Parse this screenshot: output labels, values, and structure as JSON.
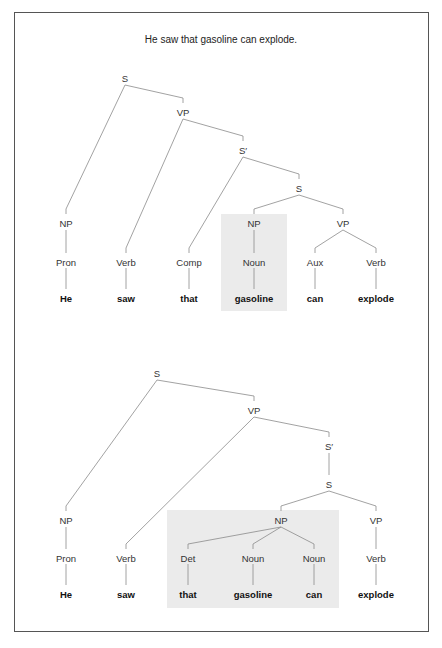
{
  "title": "He saw that gasoline can explode.",
  "colors": {
    "line": "#8a8a8a",
    "highlight": "#ebebeb",
    "border": "#555555"
  },
  "trees": [
    {
      "name": "top-tree",
      "highlight": {
        "x": 221,
        "y": 214,
        "w": 66,
        "h": 97
      },
      "nodes": [
        {
          "id": "S",
          "label": "S",
          "x": 125,
          "y": 78
        },
        {
          "id": "VP",
          "label": "VP",
          "x": 183,
          "y": 112
        },
        {
          "id": "Sp",
          "label": "S′",
          "x": 243,
          "y": 150
        },
        {
          "id": "S2",
          "label": "S",
          "x": 299,
          "y": 188
        },
        {
          "id": "NP1",
          "label": "NP",
          "x": 66,
          "y": 223
        },
        {
          "id": "NP2",
          "label": "NP",
          "x": 254,
          "y": 223
        },
        {
          "id": "VP2",
          "label": "VP",
          "x": 343,
          "y": 223
        },
        {
          "id": "Pron",
          "label": "Pron",
          "x": 66,
          "y": 262
        },
        {
          "id": "Verb1",
          "label": "Verb",
          "x": 126,
          "y": 262
        },
        {
          "id": "Comp",
          "label": "Comp",
          "x": 189,
          "y": 262
        },
        {
          "id": "Noun",
          "label": "Noun",
          "x": 254,
          "y": 262
        },
        {
          "id": "Aux",
          "label": "Aux",
          "x": 315,
          "y": 262
        },
        {
          "id": "Verb2",
          "label": "Verb",
          "x": 376,
          "y": 262
        }
      ],
      "words": [
        {
          "parent": "Pron",
          "text": "He",
          "x": 66,
          "y": 298
        },
        {
          "parent": "Verb1",
          "text": "saw",
          "x": 126,
          "y": 298
        },
        {
          "parent": "Comp",
          "text": "that",
          "x": 189,
          "y": 298
        },
        {
          "parent": "Noun",
          "text": "gasoline",
          "x": 254,
          "y": 298
        },
        {
          "parent": "Aux",
          "text": "can",
          "x": 315,
          "y": 298
        },
        {
          "parent": "Verb2",
          "text": "explode",
          "x": 376,
          "y": 298
        }
      ],
      "edges": [
        [
          "S",
          "NP1"
        ],
        [
          "S",
          "VP"
        ],
        [
          "VP",
          "Verb1"
        ],
        [
          "VP",
          "Sp"
        ],
        [
          "Sp",
          "Comp"
        ],
        [
          "Sp",
          "S2"
        ],
        [
          "S2",
          "NP2"
        ],
        [
          "S2",
          "VP2"
        ],
        [
          "NP1",
          "Pron"
        ],
        [
          "NP2",
          "Noun"
        ],
        [
          "VP2",
          "Aux"
        ],
        [
          "VP2",
          "Verb2"
        ]
      ]
    },
    {
      "name": "bottom-tree",
      "highlight": {
        "x": 167,
        "y": 510,
        "w": 172,
        "h": 98
      },
      "nodes": [
        {
          "id": "S",
          "label": "S",
          "x": 157,
          "y": 373
        },
        {
          "id": "VP",
          "label": "VP",
          "x": 254,
          "y": 410
        },
        {
          "id": "Sp",
          "label": "S′",
          "x": 329,
          "y": 446
        },
        {
          "id": "S2",
          "label": "S",
          "x": 329,
          "y": 484
        },
        {
          "id": "NP1",
          "label": "NP",
          "x": 66,
          "y": 520
        },
        {
          "id": "NP2",
          "label": "NP",
          "x": 281,
          "y": 520
        },
        {
          "id": "VP2",
          "label": "VP",
          "x": 376,
          "y": 520
        },
        {
          "id": "Pron",
          "label": "Pron",
          "x": 66,
          "y": 558
        },
        {
          "id": "Verb1",
          "label": "Verb",
          "x": 126,
          "y": 558
        },
        {
          "id": "Det",
          "label": "Det",
          "x": 188,
          "y": 558
        },
        {
          "id": "Noun1",
          "label": "Noun",
          "x": 253,
          "y": 558
        },
        {
          "id": "Noun2",
          "label": "Noun",
          "x": 314,
          "y": 558
        },
        {
          "id": "Verb2",
          "label": "Verb",
          "x": 376,
          "y": 558
        }
      ],
      "words": [
        {
          "parent": "Pron",
          "text": "He",
          "x": 66,
          "y": 594
        },
        {
          "parent": "Verb1",
          "text": "saw",
          "x": 126,
          "y": 594
        },
        {
          "parent": "Det",
          "text": "that",
          "x": 188,
          "y": 594
        },
        {
          "parent": "Noun1",
          "text": "gasoline",
          "x": 253,
          "y": 594
        },
        {
          "parent": "Noun2",
          "text": "can",
          "x": 314,
          "y": 594
        },
        {
          "parent": "Verb2",
          "text": "explode",
          "x": 376,
          "y": 594
        }
      ],
      "edges": [
        [
          "S",
          "NP1"
        ],
        [
          "S",
          "VP"
        ],
        [
          "VP",
          "Verb1"
        ],
        [
          "VP",
          "Sp"
        ],
        [
          "Sp",
          "S2"
        ],
        [
          "S2",
          "NP2"
        ],
        [
          "S2",
          "VP2"
        ],
        [
          "NP1",
          "Pron"
        ],
        [
          "NP2",
          "Det"
        ],
        [
          "NP2",
          "Noun1"
        ],
        [
          "NP2",
          "Noun2"
        ],
        [
          "VP2",
          "Verb2"
        ]
      ]
    }
  ]
}
